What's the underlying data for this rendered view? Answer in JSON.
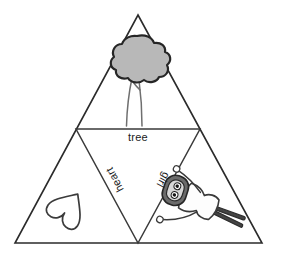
{
  "figure": {
    "background_color": "#ffffff",
    "outline_color": "#2b2b2b",
    "canvas": {
      "width": 281,
      "height": 259
    },
    "outer_triangle": {
      "apex": {
        "x": 138,
        "y": 15
      },
      "bottom_left": {
        "x": 15,
        "y": 243
      },
      "bottom_right": {
        "x": 262,
        "y": 243
      }
    },
    "inner_triangle": {
      "left": {
        "x": 76,
        "y": 129
      },
      "right": {
        "x": 200,
        "y": 129
      },
      "bottom": {
        "x": 138,
        "y": 243
      }
    },
    "panels": [
      {
        "id": "top-panel",
        "label": "tree",
        "label_orientation": "horizontal",
        "picture": "tree",
        "picture_colors": {
          "canopy_fill": "#b8b8b8",
          "canopy_stroke": "#262626",
          "trunk_stroke": "#6f6f6f"
        }
      },
      {
        "id": "left-panel",
        "label": "heart",
        "label_orientation": "rotated-upside-down-left-diagonal",
        "picture": "heart",
        "picture_colors": {
          "fill": "#ffffff",
          "stroke": "#3b3b3b"
        }
      },
      {
        "id": "right-panel",
        "label": "girl",
        "label_orientation": "rotated-upside-down-right-diagonal",
        "picture": "girl",
        "picture_colors": {
          "head_fill": "#6b6b6b",
          "body_fill": "#fdfdfd",
          "stroke": "#3a3a3a"
        }
      }
    ],
    "labels": {
      "tree": "tree",
      "heart": "heart",
      "girl": "girl"
    }
  }
}
